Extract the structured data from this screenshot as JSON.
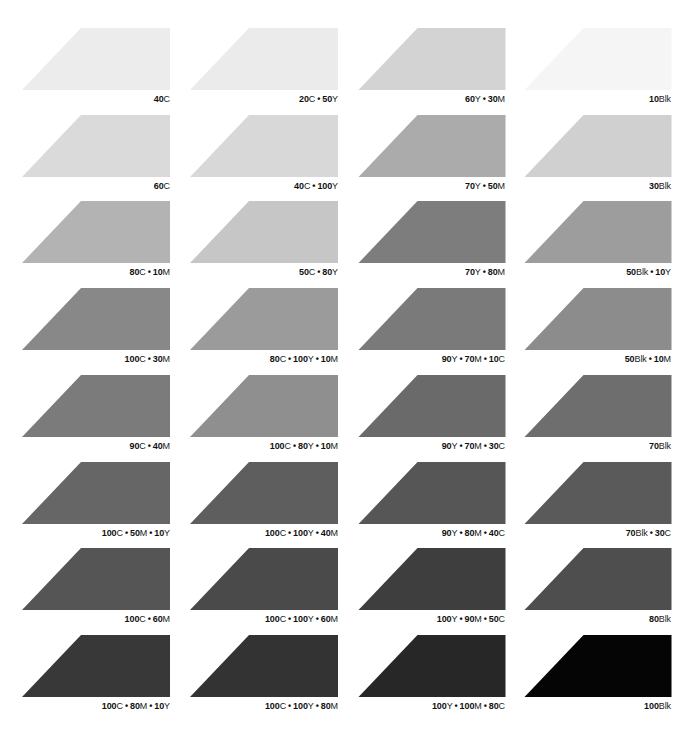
{
  "swatches": [
    {
      "label": "40C",
      "parts": [
        [
          "40",
          "C"
        ]
      ],
      "gray": "#ececec"
    },
    {
      "label": "20C • 50Y",
      "parts": [
        [
          "20",
          "C"
        ],
        [
          "50",
          "Y"
        ]
      ],
      "gray": "#ebebeb"
    },
    {
      "label": "60Y • 30M",
      "parts": [
        [
          "60",
          "Y"
        ],
        [
          "30",
          "M"
        ]
      ],
      "gray": "#d3d3d3"
    },
    {
      "label": "10Blk",
      "parts": [
        [
          "10",
          "Blk"
        ]
      ],
      "gray": "#f5f5f5"
    },
    {
      "label": "60C",
      "parts": [
        [
          "60",
          "C"
        ]
      ],
      "gray": "#dadada"
    },
    {
      "label": "40C • 100Y",
      "parts": [
        [
          "40",
          "C"
        ],
        [
          "100",
          "Y"
        ]
      ],
      "gray": "#d8d8d8"
    },
    {
      "label": "70Y • 50M",
      "parts": [
        [
          "70",
          "Y"
        ],
        [
          "50",
          "M"
        ]
      ],
      "gray": "#ababab"
    },
    {
      "label": "30Blk",
      "parts": [
        [
          "30",
          "Blk"
        ]
      ],
      "gray": "#d0d0d0"
    },
    {
      "label": "80C • 10M",
      "parts": [
        [
          "80",
          "C"
        ],
        [
          "10",
          "M"
        ]
      ],
      "gray": "#b3b3b3"
    },
    {
      "label": "50C • 80Y",
      "parts": [
        [
          "50",
          "C"
        ],
        [
          "80",
          "Y"
        ]
      ],
      "gray": "#c6c6c6"
    },
    {
      "label": "70Y • 80M",
      "parts": [
        [
          "70",
          "Y"
        ],
        [
          "80",
          "M"
        ]
      ],
      "gray": "#7d7d7d"
    },
    {
      "label": "50Blk • 10Y",
      "parts": [
        [
          "50",
          "Blk"
        ],
        [
          "10",
          "Y"
        ]
      ],
      "gray": "#9d9d9d"
    },
    {
      "label": "100C • 30M",
      "parts": [
        [
          "100",
          "C"
        ],
        [
          "30",
          "M"
        ]
      ],
      "gray": "#888888"
    },
    {
      "label": "80C • 100Y • 10M",
      "parts": [
        [
          "80",
          "C"
        ],
        [
          "100",
          "Y"
        ],
        [
          "10",
          "M"
        ]
      ],
      "gray": "#9b9b9b"
    },
    {
      "label": "90Y • 70M • 10C",
      "parts": [
        [
          "90",
          "Y"
        ],
        [
          "70",
          "M"
        ],
        [
          "10",
          "C"
        ]
      ],
      "gray": "#7a7a7a"
    },
    {
      "label": "50Blk • 10M",
      "parts": [
        [
          "50",
          "Blk"
        ],
        [
          "10",
          "M"
        ]
      ],
      "gray": "#8c8c8c"
    },
    {
      "label": "90C • 40M",
      "parts": [
        [
          "90",
          "C"
        ],
        [
          "40",
          "M"
        ]
      ],
      "gray": "#7b7b7b"
    },
    {
      "label": "100C • 80Y • 10M",
      "parts": [
        [
          "100",
          "C"
        ],
        [
          "80",
          "Y"
        ],
        [
          "10",
          "M"
        ]
      ],
      "gray": "#8f8f8f"
    },
    {
      "label": "90Y • 70M • 30C",
      "parts": [
        [
          "90",
          "Y"
        ],
        [
          "70",
          "M"
        ],
        [
          "30",
          "C"
        ]
      ],
      "gray": "#6a6a6a"
    },
    {
      "label": "70Blk",
      "parts": [
        [
          "70",
          "Blk"
        ]
      ],
      "gray": "#6e6e6e"
    },
    {
      "label": "100C • 50M • 10Y",
      "parts": [
        [
          "100",
          "C"
        ],
        [
          "50",
          "M"
        ],
        [
          "10",
          "Y"
        ]
      ],
      "gray": "#666666"
    },
    {
      "label": "100C • 100Y • 40M",
      "parts": [
        [
          "100",
          "C"
        ],
        [
          "100",
          "Y"
        ],
        [
          "40",
          "M"
        ]
      ],
      "gray": "#5e5e5e"
    },
    {
      "label": "90Y • 80M • 40C",
      "parts": [
        [
          "90",
          "Y"
        ],
        [
          "80",
          "M"
        ],
        [
          "40",
          "C"
        ]
      ],
      "gray": "#565656"
    },
    {
      "label": "70Blk • 30C",
      "parts": [
        [
          "70",
          "Blk"
        ],
        [
          "30",
          "C"
        ]
      ],
      "gray": "#5a5a5a"
    },
    {
      "label": "100C • 60M",
      "parts": [
        [
          "100",
          "C"
        ],
        [
          "60",
          "M"
        ]
      ],
      "gray": "#555555"
    },
    {
      "label": "100C • 100Y • 60M",
      "parts": [
        [
          "100",
          "C"
        ],
        [
          "100",
          "Y"
        ],
        [
          "60",
          "M"
        ]
      ],
      "gray": "#4a4a4a"
    },
    {
      "label": "100Y • 90M • 50C",
      "parts": [
        [
          "100",
          "Y"
        ],
        [
          "90",
          "M"
        ],
        [
          "50",
          "C"
        ]
      ],
      "gray": "#3e3e3e"
    },
    {
      "label": "80Blk",
      "parts": [
        [
          "80",
          "Blk"
        ]
      ],
      "gray": "#4e4e4e"
    },
    {
      "label": "100C • 80M • 10Y",
      "parts": [
        [
          "100",
          "C"
        ],
        [
          "80",
          "M"
        ],
        [
          "10",
          "Y"
        ]
      ],
      "gray": "#383838"
    },
    {
      "label": "100C • 100Y • 80M",
      "parts": [
        [
          "100",
          "C"
        ],
        [
          "100",
          "Y"
        ],
        [
          "80",
          "M"
        ]
      ],
      "gray": "#333333"
    },
    {
      "label": "100Y • 100M • 80C",
      "parts": [
        [
          "100",
          "Y"
        ],
        [
          "100",
          "M"
        ],
        [
          "80",
          "C"
        ]
      ],
      "gray": "#272727"
    },
    {
      "label": "100Blk",
      "parts": [
        [
          "100",
          "Blk"
        ]
      ],
      "gray": "#050505"
    }
  ],
  "separator": "•"
}
